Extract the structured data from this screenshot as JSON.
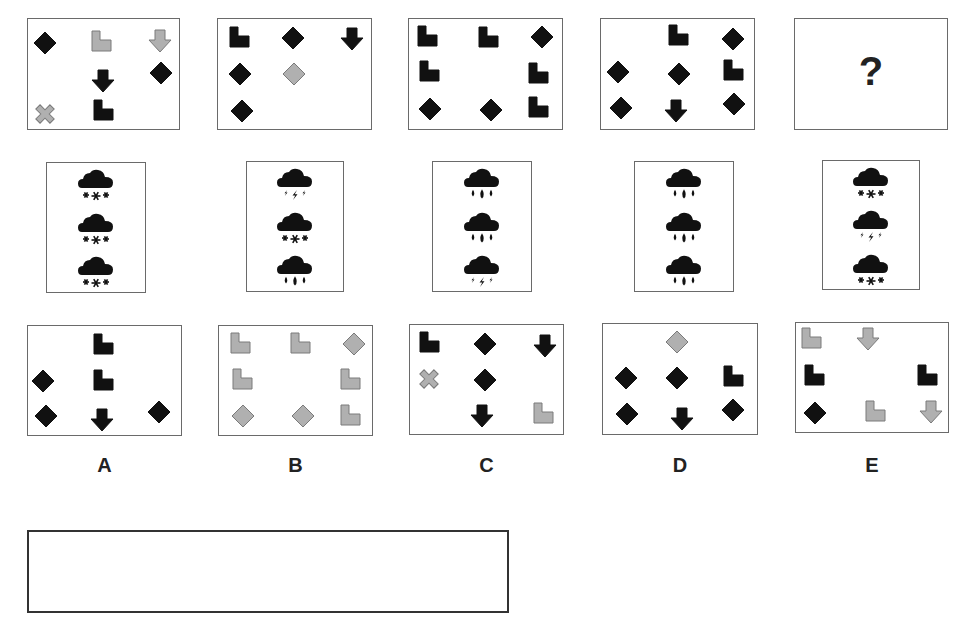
{
  "colors": {
    "black": "#111111",
    "gray": "#b0b0b0",
    "gray_stroke": "#7a7a7a",
    "border": "#6a6a6a"
  },
  "question_row": {
    "panels": [
      {
        "id": "q1",
        "x": 27,
        "y": 18,
        "w": 153,
        "h": 112,
        "shapes": [
          {
            "type": "diamond",
            "color": "black",
            "cx": 45,
            "cy": 43
          },
          {
            "type": "lshape",
            "color": "gray",
            "cx": 102,
            "cy": 42
          },
          {
            "type": "arrow",
            "color": "gray",
            "cx": 160,
            "cy": 41
          },
          {
            "type": "arrow",
            "color": "black",
            "cx": 103,
            "cy": 81
          },
          {
            "type": "diamond",
            "color": "black",
            "cx": 161,
            "cy": 73
          },
          {
            "type": "cross",
            "color": "gray",
            "cx": 45,
            "cy": 114
          },
          {
            "type": "lshape",
            "color": "black",
            "cx": 104,
            "cy": 111
          }
        ]
      },
      {
        "id": "q2",
        "x": 217,
        "y": 18,
        "w": 155,
        "h": 112,
        "shapes": [
          {
            "type": "lshape",
            "color": "black",
            "cx": 240,
            "cy": 38
          },
          {
            "type": "diamond",
            "color": "black",
            "cx": 293,
            "cy": 38
          },
          {
            "type": "arrow",
            "color": "black",
            "cx": 352,
            "cy": 39
          },
          {
            "type": "diamond",
            "color": "black",
            "cx": 240,
            "cy": 74
          },
          {
            "type": "diamond",
            "color": "gray",
            "cx": 294,
            "cy": 74
          },
          {
            "type": "diamond",
            "color": "black",
            "cx": 242,
            "cy": 111
          }
        ]
      },
      {
        "id": "q3",
        "x": 408,
        "y": 18,
        "w": 155,
        "h": 112,
        "shapes": [
          {
            "type": "lshape",
            "color": "black",
            "cx": 428,
            "cy": 37
          },
          {
            "type": "lshape",
            "color": "black",
            "cx": 489,
            "cy": 38
          },
          {
            "type": "diamond",
            "color": "black",
            "cx": 542,
            "cy": 37
          },
          {
            "type": "lshape",
            "color": "black",
            "cx": 430,
            "cy": 72
          },
          {
            "type": "lshape",
            "color": "black",
            "cx": 539,
            "cy": 74
          },
          {
            "type": "diamond",
            "color": "black",
            "cx": 430,
            "cy": 109
          },
          {
            "type": "diamond",
            "color": "black",
            "cx": 491,
            "cy": 110
          },
          {
            "type": "lshape",
            "color": "black",
            "cx": 539,
            "cy": 108
          }
        ]
      },
      {
        "id": "q4",
        "x": 600,
        "y": 18,
        "w": 155,
        "h": 112,
        "shapes": [
          {
            "type": "lshape",
            "color": "black",
            "cx": 679,
            "cy": 36
          },
          {
            "type": "diamond",
            "color": "black",
            "cx": 733,
            "cy": 39
          },
          {
            "type": "diamond",
            "color": "black",
            "cx": 618,
            "cy": 72
          },
          {
            "type": "diamond",
            "color": "black",
            "cx": 679,
            "cy": 74
          },
          {
            "type": "lshape",
            "color": "black",
            "cx": 734,
            "cy": 71
          },
          {
            "type": "diamond",
            "color": "black",
            "cx": 621,
            "cy": 108
          },
          {
            "type": "arrow",
            "color": "black",
            "cx": 676,
            "cy": 111
          },
          {
            "type": "diamond",
            "color": "black",
            "cx": 734,
            "cy": 104
          }
        ]
      },
      {
        "id": "q5",
        "x": 794,
        "y": 18,
        "w": 154,
        "h": 112,
        "question_mark": "?",
        "shapes": []
      }
    ]
  },
  "weather_row": {
    "panels": [
      {
        "id": "w1",
        "x": 46,
        "y": 162,
        "w": 100,
        "h": 131,
        "icons": [
          "snow",
          "snow",
          "snow"
        ]
      },
      {
        "id": "w2",
        "x": 246,
        "y": 161,
        "w": 98,
        "h": 131,
        "icons": [
          "thunder",
          "snow",
          "rain"
        ]
      },
      {
        "id": "w3",
        "x": 432,
        "y": 161,
        "w": 100,
        "h": 131,
        "icons": [
          "rain",
          "rain",
          "thunder"
        ]
      },
      {
        "id": "w4",
        "x": 634,
        "y": 161,
        "w": 100,
        "h": 131,
        "icons": [
          "rain",
          "rain",
          "rain"
        ]
      },
      {
        "id": "w5",
        "x": 822,
        "y": 160,
        "w": 98,
        "h": 130,
        "icons": [
          "snow",
          "thunder",
          "snow"
        ]
      }
    ]
  },
  "answer_row": {
    "panels": [
      {
        "id": "A",
        "label": "A",
        "x": 27,
        "y": 325,
        "w": 155,
        "h": 111,
        "shapes": [
          {
            "type": "lshape",
            "color": "black",
            "cx": 104,
            "cy": 345
          },
          {
            "type": "diamond",
            "color": "black",
            "cx": 43,
            "cy": 381
          },
          {
            "type": "lshape",
            "color": "black",
            "cx": 104,
            "cy": 381
          },
          {
            "type": "diamond",
            "color": "black",
            "cx": 46,
            "cy": 416
          },
          {
            "type": "arrow",
            "color": "black",
            "cx": 102,
            "cy": 420
          },
          {
            "type": "diamond",
            "color": "black",
            "cx": 159,
            "cy": 412
          }
        ]
      },
      {
        "id": "B",
        "label": "B",
        "x": 218,
        "y": 325,
        "w": 155,
        "h": 111,
        "shapes": [
          {
            "type": "lshape",
            "color": "gray",
            "cx": 241,
            "cy": 344
          },
          {
            "type": "lshape",
            "color": "gray",
            "cx": 301,
            "cy": 344
          },
          {
            "type": "diamond",
            "color": "gray",
            "cx": 354,
            "cy": 344
          },
          {
            "type": "lshape",
            "color": "gray",
            "cx": 243,
            "cy": 380
          },
          {
            "type": "lshape",
            "color": "gray",
            "cx": 351,
            "cy": 380
          },
          {
            "type": "diamond",
            "color": "gray",
            "cx": 243,
            "cy": 416
          },
          {
            "type": "diamond",
            "color": "gray",
            "cx": 303,
            "cy": 416
          },
          {
            "type": "lshape",
            "color": "gray",
            "cx": 351,
            "cy": 416
          }
        ]
      },
      {
        "id": "C",
        "label": "C",
        "x": 409,
        "y": 324,
        "w": 155,
        "h": 111,
        "shapes": [
          {
            "type": "lshape",
            "color": "black",
            "cx": 430,
            "cy": 343
          },
          {
            "type": "diamond",
            "color": "black",
            "cx": 485,
            "cy": 344
          },
          {
            "type": "arrow",
            "color": "black",
            "cx": 545,
            "cy": 346
          },
          {
            "type": "cross",
            "color": "gray",
            "cx": 429,
            "cy": 379
          },
          {
            "type": "diamond",
            "color": "black",
            "cx": 485,
            "cy": 380
          },
          {
            "type": "arrow",
            "color": "black",
            "cx": 482,
            "cy": 416
          },
          {
            "type": "lshape",
            "color": "gray",
            "cx": 544,
            "cy": 414
          }
        ]
      },
      {
        "id": "D",
        "label": "D",
        "x": 602,
        "y": 323,
        "w": 156,
        "h": 112,
        "shapes": [
          {
            "type": "diamond",
            "color": "gray",
            "cx": 677,
            "cy": 342
          },
          {
            "type": "diamond",
            "color": "black",
            "cx": 626,
            "cy": 378
          },
          {
            "type": "diamond",
            "color": "black",
            "cx": 677,
            "cy": 378
          },
          {
            "type": "lshape",
            "color": "black",
            "cx": 734,
            "cy": 377
          },
          {
            "type": "diamond",
            "color": "black",
            "cx": 627,
            "cy": 414
          },
          {
            "type": "arrow",
            "color": "black",
            "cx": 682,
            "cy": 419
          },
          {
            "type": "diamond",
            "color": "black",
            "cx": 733,
            "cy": 410
          }
        ]
      },
      {
        "id": "E",
        "label": "E",
        "x": 795,
        "y": 322,
        "w": 154,
        "h": 111,
        "shapes": [
          {
            "type": "lshape",
            "color": "gray",
            "cx": 812,
            "cy": 339
          },
          {
            "type": "arrow",
            "color": "gray",
            "cx": 868,
            "cy": 339
          },
          {
            "type": "lshape",
            "color": "black",
            "cx": 815,
            "cy": 376
          },
          {
            "type": "lshape",
            "color": "black",
            "cx": 928,
            "cy": 376
          },
          {
            "type": "diamond",
            "color": "black",
            "cx": 815,
            "cy": 413
          },
          {
            "type": "lshape",
            "color": "gray",
            "cx": 876,
            "cy": 412
          },
          {
            "type": "arrow",
            "color": "gray",
            "cx": 931,
            "cy": 412
          }
        ]
      }
    ],
    "label_y": 466
  },
  "answer_box": {
    "label": "",
    "value": ""
  }
}
